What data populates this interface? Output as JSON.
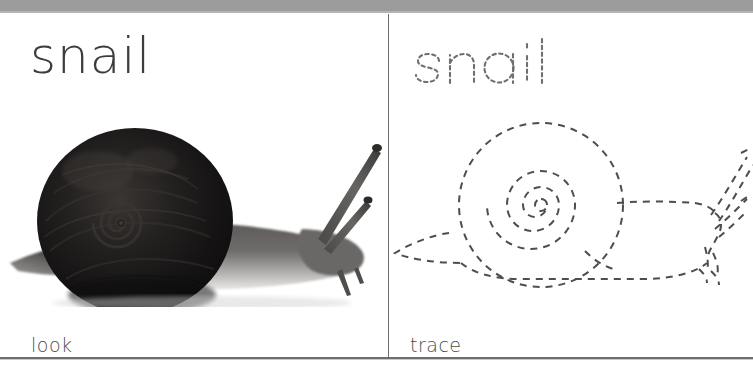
{
  "page": {
    "type": "look-and-trace-worksheet",
    "top_bar_color": "#9c9c9c",
    "background_color": "#ffffff",
    "rule_color": "#6e6e72",
    "divider_color": "#6f6f73"
  },
  "panels": {
    "look": {
      "word": "snail",
      "word_color": "#3c3c3f",
      "caption": "look",
      "caption_color": "#4a4a4d",
      "image": {
        "subject": "snail",
        "description": "photograph of a dark garden snail in left-facing shell with body crawling to the right",
        "shell_color": "#171717",
        "body_color": "#555555"
      }
    },
    "trace": {
      "word": "snail",
      "word_style": "dashed-outline",
      "word_color": "#6b6b70",
      "caption": "trace",
      "caption_color": "#4a4a4d",
      "drawing": {
        "subject": "snail",
        "description": "dashed outline tracing guide of the same snail: round spiral shell, tail at left, head with two pairs of tentacles at right",
        "stroke_color": "#4a4a4f",
        "stroke_style": "dashed"
      }
    }
  }
}
